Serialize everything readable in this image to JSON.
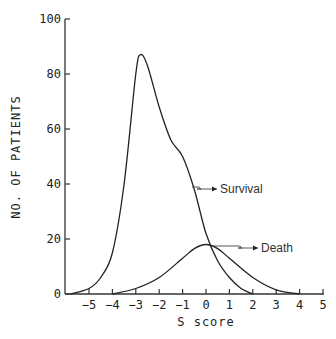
{
  "chart_data": {
    "type": "line",
    "title": "",
    "xlabel": "S score",
    "ylabel": "NO. OF PATIENTS",
    "xlim": [
      -6,
      5
    ],
    "ylim": [
      0,
      100
    ],
    "x_ticks": [
      -5,
      -4,
      -3,
      -2,
      -1,
      0,
      1,
      2,
      3,
      4,
      5
    ],
    "y_ticks": [
      0,
      20,
      40,
      60,
      80,
      100
    ],
    "grid": false,
    "legend": "inline annotations",
    "series": [
      {
        "name": "Survival",
        "x": [
          -5.8,
          -5,
          -4.5,
          -4,
          -3.5,
          -3,
          -2.8,
          -2.5,
          -2,
          -1.5,
          -1,
          -0.5,
          0,
          0.5,
          1,
          1.5,
          2
        ],
        "values": [
          0,
          2,
          6,
          15,
          40,
          80,
          87,
          83,
          68,
          56,
          50,
          38,
          22,
          12,
          6,
          2,
          0
        ]
      },
      {
        "name": "Death",
        "x": [
          -4,
          -3,
          -2,
          -1,
          -0.5,
          0,
          0.5,
          1,
          2,
          3,
          4
        ],
        "values": [
          0,
          2,
          6,
          13,
          16.5,
          18,
          16.5,
          13,
          6,
          1.5,
          0
        ]
      }
    ],
    "annotations": [
      {
        "text": "Survival",
        "points_to": "Survival curve near S=0, y≈40"
      },
      {
        "text": "Death",
        "points_to": "Death curve peak near S=0, y≈18"
      }
    ]
  }
}
